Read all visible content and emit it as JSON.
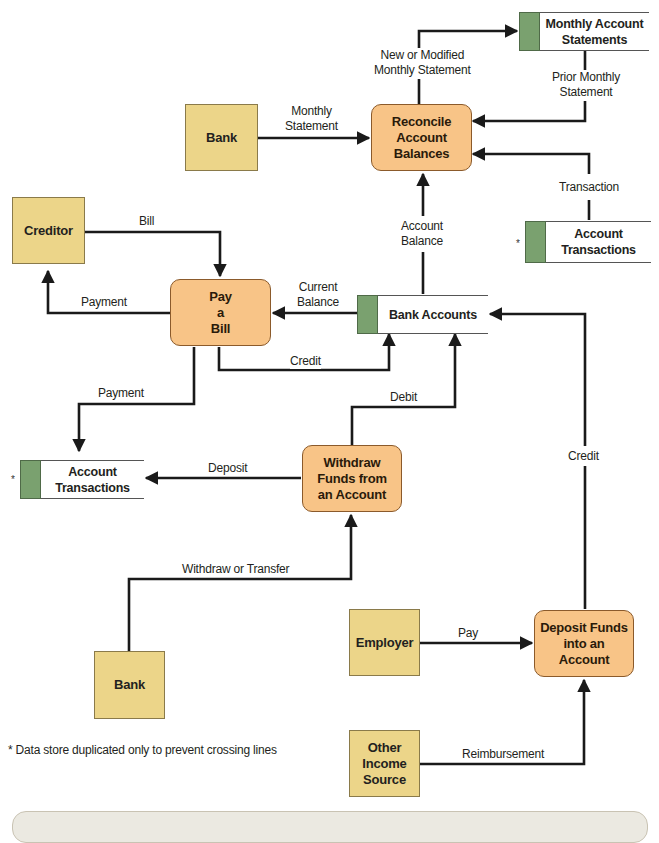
{
  "diagram": {
    "type": "data-flow-diagram",
    "external_entities": [
      {
        "id": "bank_top",
        "label": "Bank"
      },
      {
        "id": "creditor",
        "label": "Creditor"
      },
      {
        "id": "bank_bottom",
        "label": "Bank"
      },
      {
        "id": "employer",
        "label": "Employer"
      },
      {
        "id": "other_income",
        "label": "Other\nIncome\nSource"
      }
    ],
    "processes": [
      {
        "id": "reconcile",
        "label": "Reconcile\nAccount\nBalances"
      },
      {
        "id": "pay_bill",
        "label": "Pay\na\nBill"
      },
      {
        "id": "withdraw",
        "label": "Withdraw\nFunds from\nan Account"
      },
      {
        "id": "deposit",
        "label": "Deposit Funds\ninto an\nAccount"
      }
    ],
    "data_stores": [
      {
        "id": "monthly_statements",
        "label": "Monthly Account\nStatements",
        "duplicated": false
      },
      {
        "id": "account_transactions_right",
        "label": "Account\nTransactions",
        "duplicated": true
      },
      {
        "id": "bank_accounts",
        "label": "Bank Accounts",
        "duplicated": false
      },
      {
        "id": "account_transactions_left",
        "label": "Account\nTransactions",
        "duplicated": true
      }
    ],
    "flows": [
      {
        "from": "bank_top",
        "to": "reconcile",
        "label": "Monthly\nStatement"
      },
      {
        "from": "reconcile",
        "to": "monthly_statements",
        "label": "New or Modified\nMonthly Statement"
      },
      {
        "from": "monthly_statements",
        "to": "reconcile",
        "label": "Prior Monthly\nStatement"
      },
      {
        "from": "account_transactions_right",
        "to": "reconcile",
        "label": "Transaction"
      },
      {
        "from": "bank_accounts",
        "to": "reconcile",
        "label": "Account\nBalance"
      },
      {
        "from": "creditor",
        "to": "pay_bill",
        "label": "Bill"
      },
      {
        "from": "pay_bill",
        "to": "creditor",
        "label": "Payment"
      },
      {
        "from": "bank_accounts",
        "to": "pay_bill",
        "label": "Current\nBalance"
      },
      {
        "from": "pay_bill",
        "to": "bank_accounts",
        "label": "Credit"
      },
      {
        "from": "pay_bill",
        "to": "account_transactions_left",
        "label": "Payment"
      },
      {
        "from": "withdraw",
        "to": "bank_accounts",
        "label": "Debit"
      },
      {
        "from": "withdraw",
        "to": "account_transactions_left",
        "label": "Deposit"
      },
      {
        "from": "bank_bottom",
        "to": "withdraw",
        "label": "Withdraw or Transfer"
      },
      {
        "from": "deposit",
        "to": "bank_accounts",
        "label": "Credit"
      },
      {
        "from": "employer",
        "to": "deposit",
        "label": "Pay"
      },
      {
        "from": "other_income",
        "to": "deposit",
        "label": "Reimbursement"
      }
    ],
    "duplicate_marker": "*",
    "footnote": "* Data store duplicated only to prevent crossing lines"
  },
  "colors": {
    "entity_fill": "#ecd589",
    "process_fill": "#f8c487",
    "store_tab": "#7aa16f",
    "line": "#1a1a1a"
  }
}
